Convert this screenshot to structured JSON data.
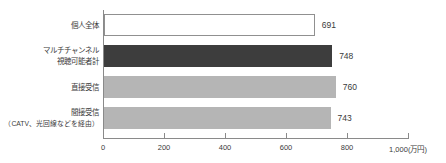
{
  "chart_data": {
    "type": "bar",
    "orientation": "horizontal",
    "title": "",
    "xlabel": "",
    "ylabel": "",
    "unit": "万円",
    "xlim": [
      0,
      1000
    ],
    "grid": false,
    "categories": [
      {
        "lines": [
          "個人全体"
        ],
        "small_second_line": false
      },
      {
        "lines": [
          "マルチチャンネル",
          "視聴可能者計"
        ],
        "small_second_line": false
      },
      {
        "lines": [
          "直接受信"
        ],
        "small_second_line": false
      },
      {
        "lines": [
          "間接受信",
          "（CATV、光回線などを経由）"
        ],
        "small_second_line": true
      }
    ],
    "values": [
      691,
      748,
      760,
      743
    ],
    "value_labels": [
      "691",
      "748",
      "760",
      "743"
    ],
    "x_ticks": [
      {
        "value": 0,
        "label": "0"
      },
      {
        "value": 200,
        "label": "200"
      },
      {
        "value": 400,
        "label": "400"
      },
      {
        "value": 600,
        "label": "600"
      },
      {
        "value": 800,
        "label": "800"
      },
      {
        "value": 1000,
        "label": "1,000(万円)"
      }
    ],
    "bar_styles": [
      {
        "fill": "#ffffff",
        "border": "#909090"
      },
      {
        "fill": "#3d3d3d",
        "border": "#3d3d3d"
      },
      {
        "fill": "#b5b5b5",
        "border": "#b5b5b5"
      },
      {
        "fill": "#b5b5b5",
        "border": "#b5b5b5"
      }
    ],
    "axis_color": "#8a8a8a",
    "text_color": "#3a3a3a"
  }
}
